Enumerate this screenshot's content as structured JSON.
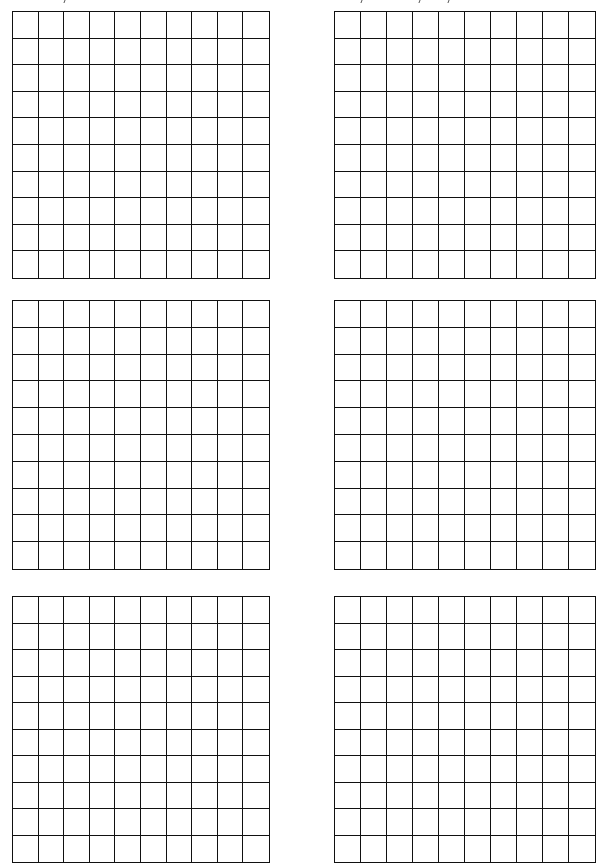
{
  "page": {
    "width": 604,
    "height": 867,
    "background": "#ffffff",
    "line_color": "#111111"
  },
  "header": {
    "note": "",
    "visible_text": ""
  },
  "grids": [
    {
      "id": "grid-row1-left",
      "rows": 10,
      "cols": 10,
      "x": 12,
      "y": 11,
      "w": 258,
      "h": 268
    },
    {
      "id": "grid-row1-right",
      "rows": 10,
      "cols": 10,
      "x": 334,
      "y": 11,
      "w": 262,
      "h": 268
    },
    {
      "id": "grid-row2-left",
      "rows": 10,
      "cols": 10,
      "x": 12,
      "y": 300,
      "w": 258,
      "h": 270
    },
    {
      "id": "grid-row2-right",
      "rows": 10,
      "cols": 10,
      "x": 334,
      "y": 300,
      "w": 262,
      "h": 270
    },
    {
      "id": "grid-row3-left",
      "rows": 10,
      "cols": 10,
      "x": 12,
      "y": 596,
      "w": 258,
      "h": 267
    },
    {
      "id": "grid-row3-right",
      "rows": 10,
      "cols": 10,
      "x": 334,
      "y": 596,
      "w": 262,
      "h": 267
    }
  ]
}
